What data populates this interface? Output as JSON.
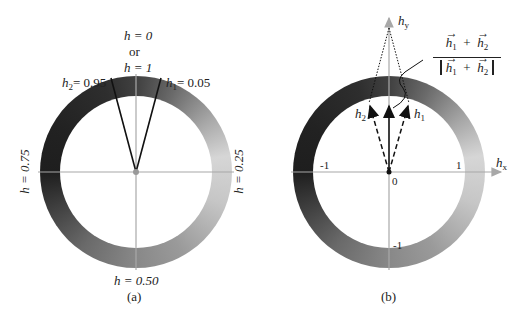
{
  "panel_a": {
    "caption": "(a)",
    "top_label_line1": "h = 0",
    "top_label_or": "or",
    "top_label_line2": "h = 1",
    "h2_label": "h",
    "h2_sub": "2",
    "h2_value": "= 0.95",
    "h1_label": "h",
    "h1_sub": "1",
    "h1_value": "= 0.05",
    "right_label": "h = 0.25",
    "left_label": "h = 0.75",
    "bottom_label": "h = 0.50"
  },
  "panel_b": {
    "caption": "(b)",
    "y_axis_label": "h",
    "y_axis_sub": "y",
    "x_axis_label": "h",
    "x_axis_sub": "x",
    "tick_neg1_x": "-1",
    "tick_pos1_x": "1",
    "tick_origin": "0",
    "tick_neg1_y": "-1",
    "vec_h1": "h",
    "vec_h1_sub": "1",
    "vec_h2": "h",
    "vec_h2_sub": "2",
    "fraction": {
      "num_a": "h",
      "num_a_sub": "1",
      "plus": "+",
      "num_b": "h",
      "num_b_sub": "2",
      "den_a": "h",
      "den_a_sub": "1",
      "den_b": "h",
      "den_b_sub": "2"
    }
  },
  "colors": {
    "ring_top": "#3a3a3a",
    "ring_right": "#d4d4d4",
    "ring_bottom": "#8a8a8a",
    "ring_left": "#1e1e1e",
    "axis": "#a8a8a8",
    "ink": "#111111"
  }
}
